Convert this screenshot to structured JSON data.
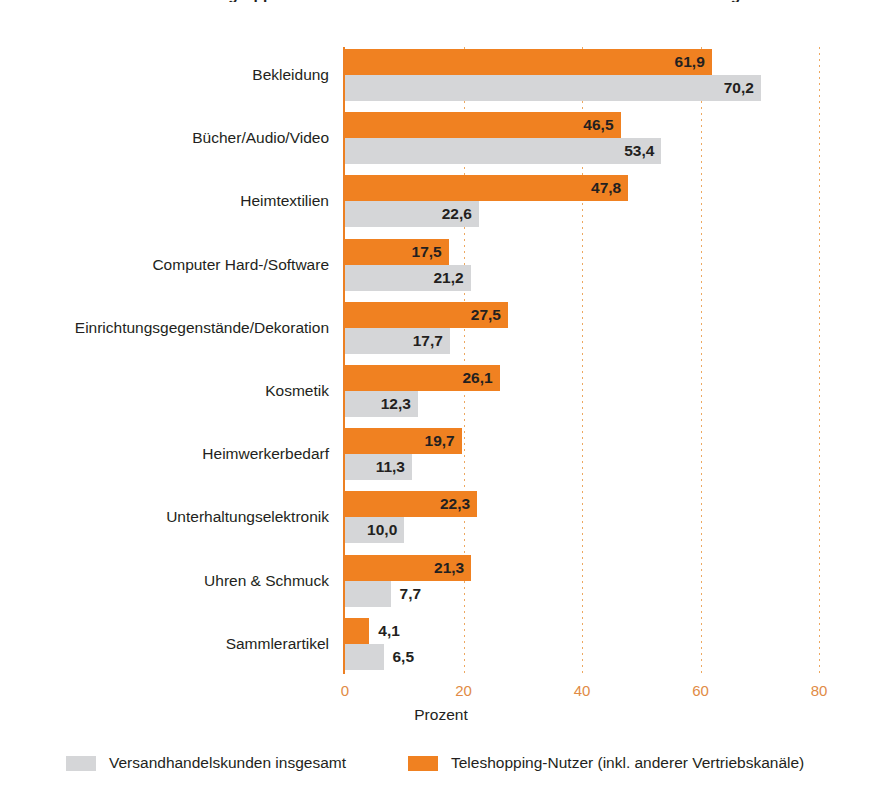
{
  "chart_data": {
    "type": "bar",
    "orientation": "horizontal",
    "title": "Bei welchen Warengruppen haben Sie in den letzten 12 Monaten im Versandhandel eingekauft?",
    "xlabel": "Prozent",
    "ylabel": "",
    "xlim": [
      0,
      80
    ],
    "xticks": [
      0,
      20,
      40,
      60,
      80
    ],
    "xtick_labels": [
      "0",
      "20",
      "40",
      "60",
      "80"
    ],
    "grid": "vertical-dotted",
    "legend_position": "bottom",
    "categories": [
      "Bekleidung",
      "Bücher/Audio/Video",
      "Heimtextilien",
      "Computer Hard-/Software",
      "Einrichtungsgegenstände/Dekoration",
      "Kosmetik",
      "Heimwerkerbedarf",
      "Unterhaltungselektronik",
      "Uhren & Schmuck",
      "Sammlerartikel"
    ],
    "series": [
      {
        "name": "Teleshopping-Nutzer (inkl. anderer Vertriebskanäle)",
        "color": "#f08121",
        "values": [
          61.9,
          46.5,
          47.8,
          17.5,
          27.5,
          26.1,
          19.7,
          22.3,
          21.3,
          4.1
        ],
        "labels": [
          "61,9",
          "46,5",
          "47,8",
          "17,5",
          "27,5",
          "26,1",
          "19,7",
          "22,3",
          "21,3",
          "4,1"
        ]
      },
      {
        "name": "Versandhandelskunden insgesamt",
        "color": "#d5d6d8",
        "values": [
          70.2,
          53.4,
          22.6,
          21.2,
          17.7,
          12.3,
          11.3,
          10.0,
          7.7,
          6.5
        ],
        "labels": [
          "70,2",
          "53,4",
          "22,6",
          "21,2",
          "17,7",
          "12,3",
          "11,3",
          "10,0",
          "7,7",
          "6,5"
        ]
      }
    ]
  },
  "legend": {
    "items": [
      {
        "label": "Versandhandelskunden insgesamt",
        "color": "#d5d6d8"
      },
      {
        "label": "Teleshopping-Nutzer (inkl. anderer Vertriebskanäle)",
        "color": "#f08121"
      }
    ]
  },
  "axis": {
    "x_title": "Prozent"
  },
  "colors": {
    "orange": "#f08121",
    "grey": "#d5d6d8",
    "axis": "#ec8023",
    "tick_text": "#e18b45",
    "text": "#231f20"
  }
}
